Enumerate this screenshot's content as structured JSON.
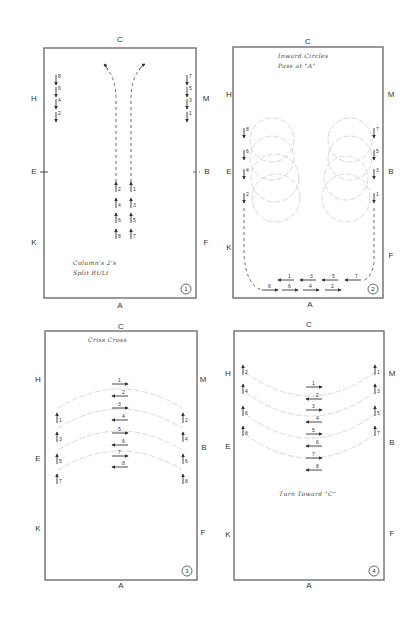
{
  "diagram": {
    "arena_letters": [
      "C",
      "H",
      "M",
      "E",
      "B",
      "K",
      "F",
      "A"
    ],
    "panels": [
      {
        "id": 1,
        "number_label": "1",
        "frame": {
          "x": 44,
          "y": 48,
          "w": 152,
          "h": 250
        },
        "letters": {
          "C": {
            "x": 120,
            "y": 40
          },
          "H": {
            "x": 34,
            "y": 99
          },
          "M": {
            "x": 206,
            "y": 99
          },
          "E": {
            "x": 34,
            "y": 172
          },
          "B": {
            "x": 207,
            "y": 172
          },
          "K": {
            "x": 34,
            "y": 243
          },
          "F": {
            "x": 206,
            "y": 243
          },
          "A": {
            "x": 120,
            "y": 306
          }
        },
        "note_lines": [
          "Column's 2's",
          "Split Rt/Lt"
        ],
        "note_pos": {
          "x": 73,
          "y": 265
        },
        "riders": [
          {
            "num": "8",
            "x": 56,
            "y": 80,
            "dir": "down"
          },
          {
            "num": "6",
            "x": 56,
            "y": 92,
            "dir": "down"
          },
          {
            "num": "4",
            "x": 56,
            "y": 104,
            "dir": "down"
          },
          {
            "num": "2",
            "x": 56,
            "y": 117,
            "dir": "down"
          },
          {
            "num": "7",
            "x": 187,
            "y": 80,
            "dir": "down"
          },
          {
            "num": "5",
            "x": 187,
            "y": 92,
            "dir": "down"
          },
          {
            "num": "3",
            "x": 187,
            "y": 104,
            "dir": "down"
          },
          {
            "num": "1",
            "x": 187,
            "y": 117,
            "dir": "down"
          },
          {
            "num": "2",
            "x": 116,
            "y": 187,
            "dir": "up"
          },
          {
            "num": "4",
            "x": 116,
            "y": 203,
            "dir": "up"
          },
          {
            "num": "6",
            "x": 116,
            "y": 218,
            "dir": "up"
          },
          {
            "num": "8",
            "x": 116,
            "y": 234,
            "dir": "up"
          },
          {
            "num": "1",
            "x": 131,
            "y": 187,
            "dir": "up"
          },
          {
            "num": "3",
            "x": 131,
            "y": 203,
            "dir": "up"
          },
          {
            "num": "5",
            "x": 131,
            "y": 218,
            "dir": "up"
          },
          {
            "num": "7",
            "x": 131,
            "y": 234,
            "dir": "up"
          }
        ]
      },
      {
        "id": 2,
        "number_label": "2",
        "frame": {
          "x": 233,
          "y": 47,
          "w": 150,
          "h": 251
        },
        "letters": {
          "C": {
            "x": 308,
            "y": 42
          },
          "H": {
            "x": 229,
            "y": 95
          },
          "M": {
            "x": 391,
            "y": 95
          },
          "E": {
            "x": 229,
            "y": 172
          },
          "B": {
            "x": 391,
            "y": 172
          },
          "K": {
            "x": 229,
            "y": 248
          },
          "F": {
            "x": 391,
            "y": 256
          },
          "A": {
            "x": 310,
            "y": 305
          }
        },
        "note_lines": [
          "Inward Circles",
          "Pass at \"A\""
        ],
        "note_pos": {
          "x": 278,
          "y": 58
        },
        "riders": [
          {
            "num": "8",
            "x": 244,
            "y": 133,
            "dir": "down"
          },
          {
            "num": "6",
            "x": 244,
            "y": 155,
            "dir": "down"
          },
          {
            "num": "4",
            "x": 244,
            "y": 174,
            "dir": "down"
          },
          {
            "num": "2",
            "x": 244,
            "y": 198,
            "dir": "down"
          },
          {
            "num": "7",
            "x": 374,
            "y": 133,
            "dir": "down"
          },
          {
            "num": "5",
            "x": 374,
            "y": 155,
            "dir": "down"
          },
          {
            "num": "3",
            "x": 374,
            "y": 174,
            "dir": "down"
          },
          {
            "num": "1",
            "x": 374,
            "y": 198,
            "dir": "down"
          },
          {
            "num": "1",
            "x": 286,
            "y": 280,
            "dir": "left"
          },
          {
            "num": "3",
            "x": 308,
            "y": 280,
            "dir": "left"
          },
          {
            "num": "5",
            "x": 330,
            "y": 280,
            "dir": "left"
          },
          {
            "num": "7",
            "x": 353,
            "y": 280,
            "dir": "left"
          },
          {
            "num": "8",
            "x": 270,
            "y": 290,
            "dir": "right"
          },
          {
            "num": "6",
            "x": 290,
            "y": 290,
            "dir": "right"
          },
          {
            "num": "4",
            "x": 311,
            "y": 290,
            "dir": "right"
          },
          {
            "num": "2",
            "x": 333,
            "y": 290,
            "dir": "right"
          }
        ],
        "circles": [
          {
            "cx": 272,
            "cy": 140,
            "r": 22
          },
          {
            "cx": 272,
            "cy": 158,
            "r": 22
          },
          {
            "cx": 275,
            "cy": 178,
            "r": 24
          },
          {
            "cx": 276,
            "cy": 198,
            "r": 24
          },
          {
            "cx": 350,
            "cy": 140,
            "r": 22
          },
          {
            "cx": 350,
            "cy": 158,
            "r": 22
          },
          {
            "cx": 346,
            "cy": 178,
            "r": 22
          },
          {
            "cx": 346,
            "cy": 198,
            "r": 24
          }
        ]
      },
      {
        "id": 3,
        "number_label": "3",
        "frame": {
          "x": 45,
          "y": 331,
          "w": 152,
          "h": 249
        },
        "letters": {
          "C": {
            "x": 121,
            "y": 327
          },
          "H": {
            "x": 38,
            "y": 380
          },
          "M": {
            "x": 203,
            "y": 380
          },
          "E": {
            "x": 38,
            "y": 459
          },
          "B": {
            "x": 204,
            "y": 448
          },
          "K": {
            "x": 38,
            "y": 529
          },
          "F": {
            "x": 203,
            "y": 533
          },
          "A": {
            "x": 121,
            "y": 586
          }
        },
        "note_lines": [
          "Criss Cross"
        ],
        "note_pos": {
          "x": 88,
          "y": 342
        },
        "riders": [
          {
            "num": "1",
            "x": 57,
            "y": 418,
            "dir": "up"
          },
          {
            "num": "3",
            "x": 57,
            "y": 437,
            "dir": "up"
          },
          {
            "num": "5",
            "x": 57,
            "y": 459,
            "dir": "up"
          },
          {
            "num": "7",
            "x": 57,
            "y": 479,
            "dir": "up"
          },
          {
            "num": "2",
            "x": 183,
            "y": 418,
            "dir": "up"
          },
          {
            "num": "4",
            "x": 183,
            "y": 437,
            "dir": "up"
          },
          {
            "num": "6",
            "x": 183,
            "y": 459,
            "dir": "up"
          },
          {
            "num": "8",
            "x": 183,
            "y": 479,
            "dir": "up"
          },
          {
            "num": "1",
            "x": 120,
            "y": 384,
            "dir": "right"
          },
          {
            "num": "2",
            "x": 120,
            "y": 396,
            "dir": "left"
          },
          {
            "num": "3",
            "x": 120,
            "y": 408,
            "dir": "right"
          },
          {
            "num": "4",
            "x": 120,
            "y": 420,
            "dir": "left"
          },
          {
            "num": "5",
            "x": 120,
            "y": 433,
            "dir": "right"
          },
          {
            "num": "6",
            "x": 120,
            "y": 445,
            "dir": "left"
          },
          {
            "num": "7",
            "x": 120,
            "y": 456,
            "dir": "right"
          },
          {
            "num": "8",
            "x": 120,
            "y": 467,
            "dir": "left"
          }
        ],
        "curves": [
          "M58 408 Q120 370 182 408",
          "M58 428 Q120 390 182 428",
          "M58 450 Q120 412 182 450",
          "M58 470 Q120 432 182 470"
        ]
      },
      {
        "id": 4,
        "number_label": "4",
        "frame": {
          "x": 234,
          "y": 331,
          "w": 150,
          "h": 249
        },
        "letters": {
          "C": {
            "x": 309,
            "y": 325
          },
          "H": {
            "x": 228,
            "y": 374
          },
          "M": {
            "x": 392,
            "y": 374
          },
          "E": {
            "x": 228,
            "y": 447
          },
          "B": {
            "x": 392,
            "y": 443
          },
          "K": {
            "x": 228,
            "y": 535
          },
          "F": {
            "x": 392,
            "y": 534
          },
          "A": {
            "x": 309,
            "y": 586
          }
        },
        "note_lines": [
          "Turn Toward \"C\""
        ],
        "note_pos": {
          "x": 279,
          "y": 496
        },
        "riders": [
          {
            "num": "2",
            "x": 243,
            "y": 370,
            "dir": "up"
          },
          {
            "num": "4",
            "x": 243,
            "y": 389,
            "dir": "up"
          },
          {
            "num": "6",
            "x": 243,
            "y": 411,
            "dir": "up"
          },
          {
            "num": "8",
            "x": 243,
            "y": 431,
            "dir": "up"
          },
          {
            "num": "1",
            "x": 375,
            "y": 370,
            "dir": "up"
          },
          {
            "num": "3",
            "x": 375,
            "y": 389,
            "dir": "up"
          },
          {
            "num": "5",
            "x": 375,
            "y": 411,
            "dir": "up"
          },
          {
            "num": "7",
            "x": 375,
            "y": 431,
            "dir": "up"
          },
          {
            "num": "1",
            "x": 314,
            "y": 387,
            "dir": "right"
          },
          {
            "num": "2",
            "x": 314,
            "y": 399,
            "dir": "left"
          },
          {
            "num": "3",
            "x": 314,
            "y": 410,
            "dir": "right"
          },
          {
            "num": "4",
            "x": 314,
            "y": 422,
            "dir": "left"
          },
          {
            "num": "5",
            "x": 314,
            "y": 434,
            "dir": "right"
          },
          {
            "num": "6",
            "x": 314,
            "y": 446,
            "dir": "left"
          },
          {
            "num": "7",
            "x": 314,
            "y": 458,
            "dir": "right"
          },
          {
            "num": "8",
            "x": 314,
            "y": 470,
            "dir": "left"
          }
        ],
        "curves": [
          "M245 372 Q310 420 375 372",
          "M245 392 Q310 440 375 392",
          "M245 414 Q310 462 375 414",
          "M245 434 Q310 482 375 434"
        ]
      }
    ]
  }
}
